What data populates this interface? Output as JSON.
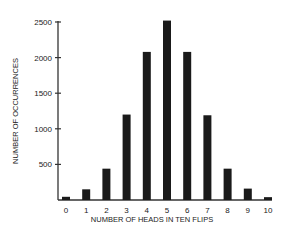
{
  "chart_data": {
    "type": "bar",
    "title": "",
    "xlabel": "NUMBER OF HEADS IN TEN FLIPS",
    "ylabel": "NUMBER OF OCCURRENCES",
    "categories": [
      "0",
      "1",
      "2",
      "3",
      "4",
      "5",
      "6",
      "7",
      "8",
      "9",
      "10"
    ],
    "values": [
      45,
      150,
      440,
      1200,
      2080,
      2520,
      2080,
      1190,
      440,
      160,
      40
    ],
    "yticks": [
      500,
      1000,
      1500,
      2000,
      2500
    ],
    "ytick_labels": [
      "500",
      "1000",
      "1500",
      "2000",
      "2500"
    ],
    "ylim": [
      0,
      2500
    ],
    "grid": false,
    "legend": "none",
    "colors": {
      "bar": "#1a1a1a",
      "axis": "#333333"
    }
  }
}
